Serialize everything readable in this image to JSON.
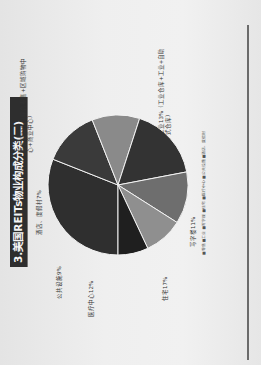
{
  "slide": {
    "title": "3.美国REITs物业构成分类(二)"
  },
  "chart_data": {
    "type": "pie",
    "title": "3.美国REITs物业构成分类(二)",
    "categories": [
      "零售",
      "工业",
      "写字楼",
      "住宅",
      "医疗中心",
      "公共设施",
      "酒店、度假村"
    ],
    "values": [
      31,
      13,
      11,
      17,
      12,
      9,
      7
    ],
    "unit": "%",
    "slice_labels": [
      "零售业31%（综合零售+区域购物中心+商业中心）",
      "工业13%（工业仓库+工业+自助式仓库）",
      "写字楼11%",
      "住宅17%",
      "医疗中心12%",
      "公共设施9%",
      "酒店、度假村7%"
    ],
    "colors": [
      "#2f2f2f",
      "#3a3a3a",
      "#8a8a8a",
      "#333333",
      "#6e6e6e",
      "#8f8f8f",
      "#1f1f1f"
    ],
    "legend_position": "bottom",
    "legend": [
      "零售",
      "工业",
      "写字楼",
      "住宅",
      "医疗中心",
      "公共设施",
      "酒店、度假村"
    ]
  },
  "labels": {
    "retail": "零售业31%（综合零售+区域购物中",
    "retail_2": "心+商业中心）",
    "industrial": "工业13%（工业仓库+工业+自助",
    "industrial_2": "式仓库）",
    "office": "写字楼11%",
    "residential": "住宅17%",
    "healthcare": "医疗中心12%",
    "public": "公共设施9%",
    "hotel": "酒店、度假村7%"
  },
  "legend_text": "■零售 ■工业 ■写字楼 ■住宅 ■医疗中心 ■公共设施 ■酒店、度假村"
}
